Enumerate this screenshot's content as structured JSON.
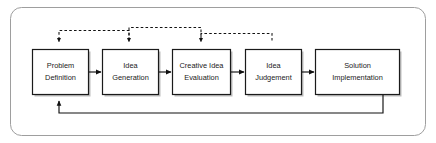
{
  "diagram": {
    "type": "flowchart",
    "orientation": "left-to-right",
    "frame": {
      "shape": "rounded-rectangle",
      "border_color": "#9a9a9a",
      "fill_color": "#ffffff"
    },
    "node_style": {
      "shape": "rectangle",
      "border_color": "#1a1a1a",
      "fill_color": "#ffffff",
      "text_color": "#1a1a1a",
      "shadow_color": "#b4b4b4"
    },
    "nodes": [
      {
        "id": "problem-definition",
        "line1": "Problem",
        "line2": "Definition"
      },
      {
        "id": "idea-generation",
        "line1": "Idea",
        "line2": "Generation"
      },
      {
        "id": "creative-idea-evaluation",
        "line1": "Creative Idea",
        "line2": "Evaluation"
      },
      {
        "id": "idea-judgement",
        "line1": "Idea",
        "line2": "Judgement"
      },
      {
        "id": "solution-implementation",
        "line1": "Solution",
        "line2": "Implementation"
      }
    ],
    "forward_connectors": [
      {
        "id": "problem-definition-to-idea-generation",
        "style": "solid",
        "arrow": "right"
      },
      {
        "id": "idea-generation-to-creative-idea-evaluation",
        "style": "solid",
        "arrow": "right"
      },
      {
        "id": "creative-idea-evaluation-to-idea-judgement",
        "style": "solid",
        "arrow": "right"
      },
      {
        "id": "idea-judgement-to-solution-implementation",
        "style": "solid",
        "arrow": "right"
      }
    ],
    "feedback_connectors": [
      {
        "id": "idea-generation-to-problem-definition",
        "style": "dashed",
        "arrow": "down",
        "position": "top"
      },
      {
        "id": "creative-idea-evaluation-to-idea-generation",
        "style": "dashed",
        "arrow": "down",
        "position": "top"
      },
      {
        "id": "idea-judgement-to-creative-idea-evaluation",
        "style": "dashed",
        "arrow": "down",
        "position": "top"
      },
      {
        "id": "solution-implementation-to-problem-definition",
        "style": "solid",
        "arrow": "up",
        "position": "bottom"
      }
    ]
  }
}
